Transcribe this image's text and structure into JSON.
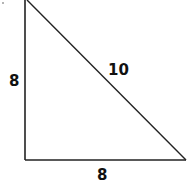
{
  "diagram": {
    "type": "right-triangle",
    "stroke_color": "#222222",
    "sides": {
      "left_leg": "8",
      "bottom_leg": "8",
      "hypotenuse": "10"
    }
  }
}
